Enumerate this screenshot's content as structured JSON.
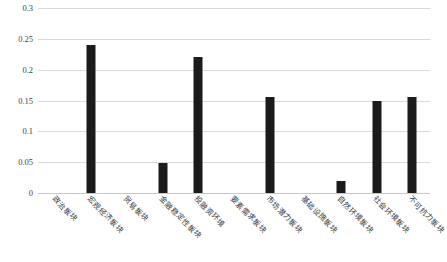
{
  "chart_data": {
    "type": "bar",
    "title": "",
    "subtitle": "",
    "xlabel": "",
    "ylabel": "",
    "ylim": [
      0,
      0.3
    ],
    "grid": true,
    "legend": false,
    "yticks": [
      "0.3",
      "0.25",
      "0.2",
      "0.15",
      "0.1",
      "0.05",
      "0"
    ],
    "ytick_values": [
      0.3,
      0.25,
      0.2,
      0.15,
      0.1,
      0.05,
      0
    ],
    "categories": [
      "政治板块",
      "宏观经济板块",
      "贸易板块",
      "金融稳定性板块",
      "投融资环境",
      "要素需求板块",
      "市场潜力板块",
      "基础设施板块",
      "自然环境板块",
      "社会环境板块",
      "不可抗力板块"
    ],
    "values": [
      0,
      0.24,
      0,
      0.048,
      0.22,
      0,
      0.155,
      0,
      0.019,
      0.149,
      0.155
    ],
    "bar_color": "#1b1b1b",
    "grid_color": "#d9d9d9"
  },
  "caption": {
    "text": ""
  }
}
